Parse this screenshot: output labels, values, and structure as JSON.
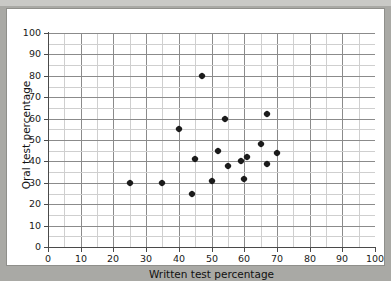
{
  "figure": {
    "background_color": "#ffffff",
    "page_color": "#a9a9a5",
    "marker_color": "#1b1b1b",
    "grid_color": "#8b8b8b",
    "minor_grid_color": "#cfcfcf"
  },
  "chart_data": {
    "type": "scatter",
    "title": "",
    "xlabel": "Written test percentage",
    "ylabel": "Oral test percentage",
    "xlim": [
      0,
      100
    ],
    "ylim": [
      0,
      100
    ],
    "xticks": [
      0,
      10,
      20,
      30,
      40,
      50,
      60,
      70,
      80,
      90,
      100
    ],
    "yticks": [
      0,
      10,
      20,
      30,
      40,
      50,
      60,
      70,
      80,
      90,
      100
    ],
    "xtick_labels": [
      "0",
      "10",
      "20",
      "30",
      "40",
      "50",
      "60",
      "70",
      "80",
      "90",
      "100"
    ],
    "ytick_labels": [
      "0",
      "10",
      "20",
      "30",
      "40",
      "50",
      "60",
      "70",
      "80",
      "90",
      "100"
    ],
    "grid": true,
    "minor_grid": true,
    "minor_tick_interval": 5,
    "legend": null,
    "marker": "diamond",
    "points": [
      {
        "x": 25,
        "y": 30
      },
      {
        "x": 35,
        "y": 30
      },
      {
        "x": 40,
        "y": 55
      },
      {
        "x": 44,
        "y": 25
      },
      {
        "x": 45,
        "y": 41
      },
      {
        "x": 47,
        "y": 80
      },
      {
        "x": 50,
        "y": 31
      },
      {
        "x": 52,
        "y": 45
      },
      {
        "x": 54,
        "y": 60
      },
      {
        "x": 55,
        "y": 38
      },
      {
        "x": 59,
        "y": 40
      },
      {
        "x": 60,
        "y": 32
      },
      {
        "x": 61,
        "y": 42
      },
      {
        "x": 65,
        "y": 48
      },
      {
        "x": 67,
        "y": 62
      },
      {
        "x": 67,
        "y": 39
      },
      {
        "x": 70,
        "y": 44
      }
    ]
  }
}
